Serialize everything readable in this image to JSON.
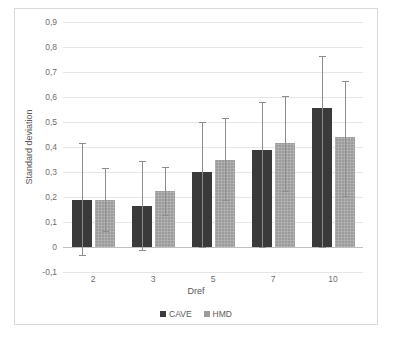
{
  "chart_data": {
    "type": "bar",
    "title": "",
    "xlabel": "Dref",
    "ylabel": "Standard deviation",
    "categories": [
      "2",
      "3",
      "5",
      "7",
      "10"
    ],
    "ylim": [
      -0.1,
      0.9
    ],
    "ytick_labels": [
      "0,9",
      "0,8",
      "0,7",
      "0,6",
      "0,5",
      "0,4",
      "0,3",
      "0,2",
      "0,1",
      "0",
      "-0,1"
    ],
    "ytick_values": [
      0.9,
      0.8,
      0.7,
      0.6,
      0.5,
      0.4,
      0.3,
      0.2,
      0.1,
      0,
      -0.1
    ],
    "grid": true,
    "legend_position": "bottom",
    "decimal_separator": ",",
    "series": [
      {
        "name": "CAVE",
        "color": "#3a3a3a",
        "values": [
          0.19,
          0.165,
          0.3,
          0.39,
          0.555
        ],
        "err_low": [
          -0.03,
          -0.01,
          0.0,
          0.0,
          0.0
        ],
        "err_high": [
          0.415,
          0.345,
          0.5,
          0.58,
          0.765
        ]
      },
      {
        "name": "HMD",
        "color": "#9b9b9b",
        "values": [
          0.19,
          0.225,
          0.35,
          0.415,
          0.44
        ],
        "err_low": [
          0.065,
          0.13,
          0.19,
          0.225,
          0.205
        ],
        "err_high": [
          0.315,
          0.32,
          0.515,
          0.605,
          0.665
        ]
      }
    ]
  }
}
